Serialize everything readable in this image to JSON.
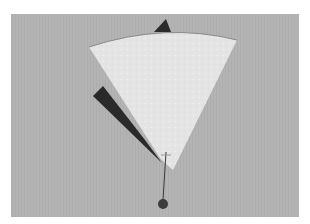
{
  "image": {
    "subject": "paper fan-shaped mobile with black triangles and a hanging weight",
    "colors": {
      "page": "#ffffff",
      "backdrop": "#b4b4b4",
      "fan": "#e6e6e6",
      "fan_edge": "#8a8a8a",
      "dark_shape": "#2a2a2a",
      "string": "#3a3a3a",
      "weight": "#3c3c3c"
    }
  }
}
